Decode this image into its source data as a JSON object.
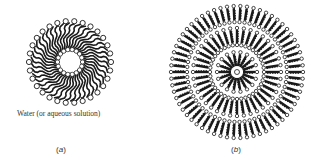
{
  "figure": {
    "panel_a": {
      "label": "(a)",
      "letter": "a",
      "caption": "Water (or aqueous solution)",
      "description": "reverse micelle with aqueous core",
      "center": [
        70,
        62
      ],
      "inner_radius": 11,
      "outer_radius": 42,
      "head_count_outer": 30,
      "head_count_inner": 18
    },
    "panel_b": {
      "label": "(b)",
      "letter": "b",
      "description": "multilamellar vesicle (concentric bilayers)",
      "center": [
        237,
        72
      ],
      "rx": 67,
      "ry": 67,
      "layers": 3
    },
    "colors": {
      "ink": "#1a1a1a",
      "head_fill": "#ffffff",
      "background": "#ffffff",
      "text": "#333333"
    }
  }
}
